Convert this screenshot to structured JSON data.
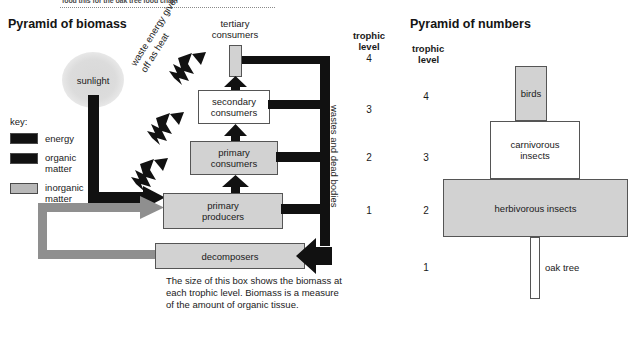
{
  "top_caption": "food this for the oak tree food chain",
  "left_panel": {
    "title": "Pyramid of biomass",
    "sunlight_label": "sunlight",
    "waste_heat_label_line1": "waste energy given",
    "waste_heat_label_line2": "off as heat",
    "wastes_label": "wastes and dead bodies",
    "trophic_header_line1": "trophic",
    "trophic_header_line2": "level",
    "trophic_levels": [
      "4",
      "3",
      "2",
      "1"
    ],
    "boxes": [
      {
        "label": "tertiary consumers",
        "label_line1": "tertiary",
        "label_line2": "consumers",
        "fill": "gray"
      },
      {
        "label": "secondary consumers",
        "label_line1": "secondary",
        "label_line2": "consumers",
        "fill": "white"
      },
      {
        "label": "primary consumers",
        "label_line1": "primary",
        "label_line2": "consumers",
        "fill": "gray"
      },
      {
        "label": "primary producers",
        "label_line1": "primary",
        "label_line2": "producers",
        "fill": "gray"
      },
      {
        "label": "decomposers",
        "label_line1": "decomposers",
        "label_line2": "",
        "fill": "gray"
      }
    ],
    "caption": "The size of this box shows the biomass at each trophic level. Biomass is a measure of the amount of organic tissue."
  },
  "key": {
    "title": "key:",
    "items": [
      {
        "label": "energy",
        "color": "#111111",
        "swatch": "black"
      },
      {
        "label": "organic matter",
        "label_line1": "organic",
        "label_line2": "matter",
        "color": "#111111",
        "swatch": "black"
      },
      {
        "label": "inorganic matter",
        "label_line1": "inorganic",
        "label_line2": "matter",
        "color": "#b8b8b8",
        "swatch": "gray"
      }
    ]
  },
  "right_panel": {
    "title": "Pyramid of numbers",
    "trophic_header_line1": "trophic",
    "trophic_header_line2": "level",
    "trophic_levels": [
      "4",
      "3",
      "2",
      "1"
    ],
    "bars": [
      {
        "label": "birds",
        "level": "4",
        "fill": "gray"
      },
      {
        "label": "carnivorous insects",
        "label_line1": "carnivorous",
        "label_line2": "insects",
        "level": "3",
        "fill": "white"
      },
      {
        "label": "herbivorous insects",
        "level": "2",
        "fill": "gray"
      },
      {
        "label": "oak tree",
        "level": "1",
        "fill": "white"
      }
    ]
  },
  "colors": {
    "energy": "#111111",
    "inorganic": "#8f8f8f",
    "box_fill_gray": "#d2d2d2",
    "box_fill_white": "#ffffff",
    "stroke": "#555555"
  }
}
